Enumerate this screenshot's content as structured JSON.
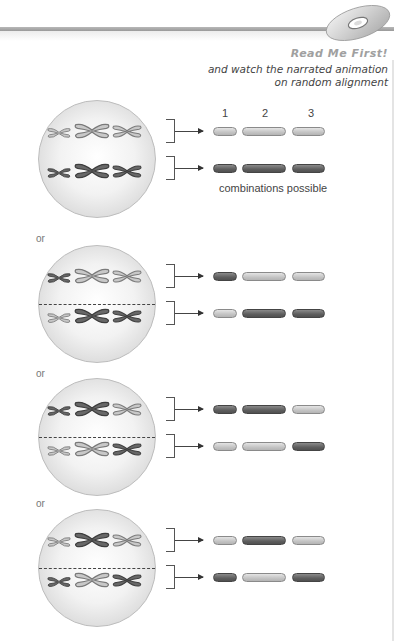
{
  "header": {
    "callout_title": "Read Me First!",
    "callout_text_line1": "and watch the narrated animation",
    "callout_text_line2": "on random alignment",
    "icon": "cd-disc-icon"
  },
  "columns": [
    "1",
    "2",
    "3"
  ],
  "caption": "combinations possible",
  "separator_label": "or",
  "colors": {
    "light_chromosome": "#c8c8c8",
    "dark_chromosome": "#686868",
    "cell_fill": "#f0f0f0"
  },
  "arrangements": [
    {
      "top_row": [
        "light",
        "light",
        "light"
      ],
      "bottom_row": [
        "dark",
        "dark",
        "dark"
      ],
      "result_top": [
        "light",
        "light",
        "light"
      ],
      "result_bottom": [
        "dark",
        "dark",
        "dark"
      ],
      "has_equator": false
    },
    {
      "top_row": [
        "dark",
        "light",
        "light"
      ],
      "bottom_row": [
        "light",
        "dark",
        "dark"
      ],
      "result_top": [
        "dark",
        "light",
        "light"
      ],
      "result_bottom": [
        "light",
        "dark",
        "dark"
      ],
      "has_equator": true
    },
    {
      "top_row": [
        "dark",
        "dark",
        "light"
      ],
      "bottom_row": [
        "light",
        "light",
        "dark"
      ],
      "result_top": [
        "dark",
        "dark",
        "light"
      ],
      "result_bottom": [
        "light",
        "light",
        "dark"
      ],
      "has_equator": true
    },
    {
      "top_row": [
        "light",
        "dark",
        "light"
      ],
      "bottom_row": [
        "dark",
        "light",
        "dark"
      ],
      "result_top": [
        "light",
        "dark",
        "light"
      ],
      "result_bottom": [
        "dark",
        "light",
        "dark"
      ],
      "has_equator": true
    }
  ]
}
